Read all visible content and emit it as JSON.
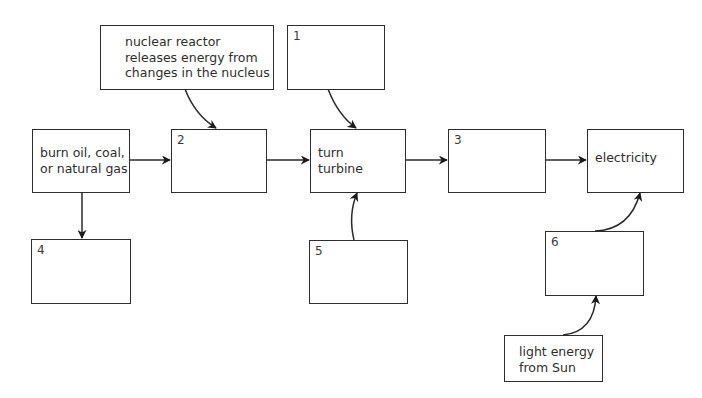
{
  "diagram": {
    "boxes": {
      "nuclear": {
        "text": "nuclear reactor\nreleases energy from\nchanges in the nucleus"
      },
      "box1": {
        "label": "1",
        "text": ""
      },
      "burn": {
        "text": "burn oil, coal,\nor natural gas"
      },
      "box2": {
        "label": "2",
        "text": ""
      },
      "turbine": {
        "text": "turn\nturbine"
      },
      "box3": {
        "label": "3",
        "text": ""
      },
      "electricity": {
        "text": "electricity"
      },
      "box4": {
        "label": "4",
        "text": ""
      },
      "box5": {
        "label": "5",
        "text": ""
      },
      "box6": {
        "label": "6",
        "text": ""
      },
      "light": {
        "text": "light energy\nfrom Sun"
      }
    },
    "edges": [
      {
        "from": "burn",
        "to": "box2"
      },
      {
        "from": "nuclear",
        "to": "box2"
      },
      {
        "from": "box2",
        "to": "turbine"
      },
      {
        "from": "box1",
        "to": "turbine"
      },
      {
        "from": "box5",
        "to": "turbine"
      },
      {
        "from": "turbine",
        "to": "box3"
      },
      {
        "from": "box3",
        "to": "electricity"
      },
      {
        "from": "burn",
        "to": "box4"
      },
      {
        "from": "box6",
        "to": "electricity"
      },
      {
        "from": "light",
        "to": "box6"
      }
    ],
    "colors": {
      "stroke": "#2d2d2d",
      "background": "#ffffff"
    }
  }
}
